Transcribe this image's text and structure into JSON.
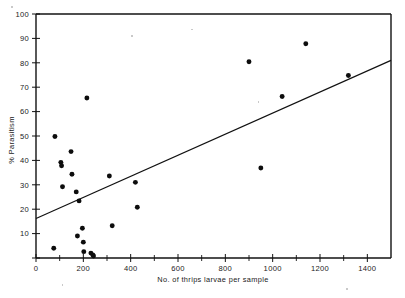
{
  "chart_data": {
    "type": "scatter",
    "title": "",
    "xlabel": "No. of thrips larvae per sample",
    "ylabel": "% Parasitism",
    "xlim": [
      0,
      1500
    ],
    "ylim": [
      0,
      100
    ],
    "grid": false,
    "legend": null,
    "x_ticks_major": [
      0,
      200,
      400,
      600,
      800,
      1000,
      1200,
      1400
    ],
    "x_ticklabels": [
      "0",
      "200",
      "400",
      "600",
      "800",
      "1000",
      "1200",
      "1400"
    ],
    "x_ticks_minor": [
      100,
      300,
      500,
      700,
      900,
      1100,
      1300,
      1500
    ],
    "y_ticks_major": [
      0,
      10,
      20,
      30,
      40,
      50,
      60,
      70,
      80,
      90,
      100
    ],
    "y_ticklabels": [
      "",
      "10",
      "20",
      "30",
      "40",
      "50",
      "60",
      "70",
      "80",
      "90",
      "100"
    ],
    "points": [
      {
        "x": 75,
        "y": 4.0
      },
      {
        "x": 80,
        "y": 49.8
      },
      {
        "x": 105,
        "y": 39.2
      },
      {
        "x": 108,
        "y": 37.8
      },
      {
        "x": 112,
        "y": 29.2
      },
      {
        "x": 148,
        "y": 43.6
      },
      {
        "x": 152,
        "y": 34.3
      },
      {
        "x": 170,
        "y": 27.1
      },
      {
        "x": 175,
        "y": 9.0
      },
      {
        "x": 182,
        "y": 23.4
      },
      {
        "x": 196,
        "y": 12.2
      },
      {
        "x": 200,
        "y": 6.5
      },
      {
        "x": 202,
        "y": 2.6
      },
      {
        "x": 215,
        "y": 65.6
      },
      {
        "x": 232,
        "y": 2.0
      },
      {
        "x": 240,
        "y": 1.2
      },
      {
        "x": 243,
        "y": 0.8
      },
      {
        "x": 310,
        "y": 33.6
      },
      {
        "x": 322,
        "y": 13.2
      },
      {
        "x": 420,
        "y": 31.0
      },
      {
        "x": 428,
        "y": 20.8
      },
      {
        "x": 900,
        "y": 80.4
      },
      {
        "x": 950,
        "y": 36.9
      },
      {
        "x": 1040,
        "y": 66.2
      },
      {
        "x": 1140,
        "y": 87.8
      },
      {
        "x": 1320,
        "y": 74.8
      }
    ],
    "fit_line": {
      "name": "regression line",
      "x0": 0,
      "y0": 16.2,
      "x1": 1500,
      "y1": 81.0
    }
  },
  "colors": {
    "ink": "#121212",
    "point": "#0d0d0d",
    "background": "#ffffff"
  }
}
